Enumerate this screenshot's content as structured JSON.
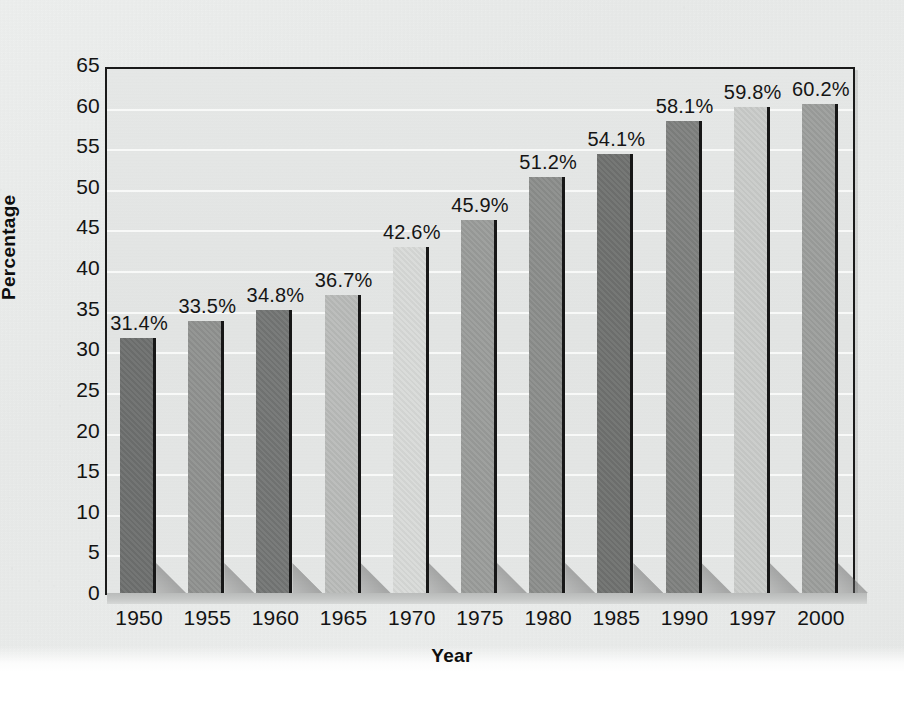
{
  "chart_data": {
    "type": "bar",
    "title": "",
    "xlabel": "Year",
    "ylabel": "Percentage",
    "categories": [
      "1950",
      "1955",
      "1960",
      "1965",
      "1970",
      "1975",
      "1980",
      "1985",
      "1990",
      "1997",
      "2000"
    ],
    "values": [
      31.4,
      33.5,
      34.8,
      36.7,
      42.6,
      45.9,
      51.2,
      54.1,
      58.1,
      59.8,
      60.2
    ],
    "data_labels": [
      "31.4%",
      "33.5%",
      "34.8%",
      "36.7%",
      "42.6%",
      "45.9%",
      "51.2%",
      "54.1%",
      "58.1%",
      "59.8%",
      "60.2%"
    ],
    "ylim": [
      0,
      65
    ],
    "ytick_step": 5,
    "yticks": [
      "0",
      "5",
      "10",
      "15",
      "20",
      "25",
      "30",
      "35",
      "40",
      "45",
      "50",
      "55",
      "60",
      "65"
    ],
    "grid": "horizontal",
    "legend": "none",
    "bar_colors": [
      "#6d6f6e",
      "#8f918f",
      "#737574",
      "#b9bbb9",
      "#d8dad8",
      "#9a9c9a",
      "#8b8d8b",
      "#6f716f",
      "#7e807e",
      "#c9cbc9",
      "#9c9e9c"
    ],
    "colors": {
      "plot_background": "#e4e6e5",
      "page_background": "#ebedec",
      "axis": "#1a1a1a",
      "gridline": "#fafbfa",
      "text": "#131313",
      "bar_edge": "#171717"
    }
  }
}
